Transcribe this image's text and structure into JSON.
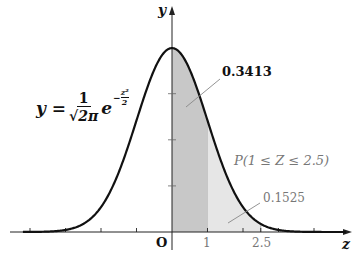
{
  "chart_data": {
    "type": "area",
    "function_label": "y = 1/√(2π) e^(−z²/2)",
    "xlabel": "z",
    "ylabel": "y",
    "origin_label": "O",
    "xlim": [
      -4.5,
      5.1
    ],
    "ylim": [
      0,
      0.42
    ],
    "x_ticks": [
      -4,
      -3,
      -2,
      -1,
      0,
      1,
      2,
      2.5,
      3,
      4
    ],
    "x_tick_labels": {
      "1": "1",
      "2.5": "2.5"
    },
    "y_ticks": [
      0.1,
      0.2,
      0.3
    ],
    "curve": {
      "x": [
        -4,
        -3,
        -2,
        -1,
        0,
        1,
        2,
        3,
        4
      ],
      "y": [
        0.0001,
        0.0044,
        0.054,
        0.242,
        0.3989,
        0.242,
        0.054,
        0.0044,
        0.0001
      ]
    },
    "shaded_regions": [
      {
        "from": 0,
        "to": 1,
        "color": "#c8c8c8",
        "label": "0.3413",
        "meaning": "P(0 ≤ Z ≤ 1)"
      },
      {
        "from": 1,
        "to": 2.5,
        "color": "#e6e6e6",
        "label": "0.1525",
        "meaning": "P(1 ≤ Z ≤ 2.5)"
      }
    ],
    "annotations": [
      "0.3413",
      "P(1 ≤ Z ≤ 2.5)",
      "0.1525"
    ],
    "grid": false,
    "legend": "none"
  },
  "labels": {
    "y_axis": "y",
    "z_axis": "z",
    "origin": "O",
    "tick_1": "1",
    "tick_2_5": "2.5",
    "area1_value": "0.3413",
    "area2_prob": "P(1 ≤ Z ≤ 2.5)",
    "area2_value": "0.1525",
    "formula_lhs": "y =",
    "formula_num": "1",
    "formula_den": "√2π",
    "formula_e": "e",
    "formula_exp_sign": "−",
    "formula_exp_num": "z²",
    "formula_exp_den": "2"
  },
  "colors": {
    "curve": "#111111",
    "axis": "#222222",
    "region1": "#c8c8c8",
    "region2": "#e6e6e6",
    "leader": "#888888",
    "annotation_gray": "#777777"
  }
}
